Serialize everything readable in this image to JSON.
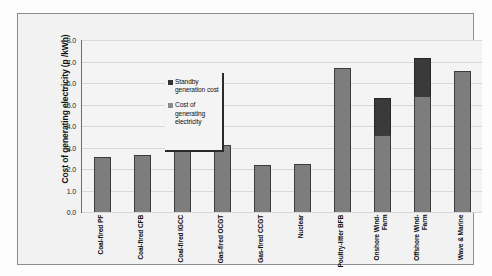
{
  "chart_data": {
    "type": "bar",
    "stacked": true,
    "title": "",
    "xlabel": "",
    "ylabel": "Cost of generating electricity (p /kWh)",
    "ylim": [
      0.0,
      8.0
    ],
    "ytick_labels": [
      "8.0",
      "7.0",
      "6.0",
      "5.0",
      "4.0",
      "3.0",
      "2.0",
      "1.0",
      "0.0"
    ],
    "ytick_values": [
      8.0,
      7.0,
      6.0,
      5.0,
      4.0,
      3.0,
      2.0,
      1.0,
      0.0
    ],
    "grid": true,
    "legend_position": "inside-top-left",
    "categories": [
      "Coal-fired PF",
      "Coal-fired CFB",
      "Coal-fired IGCC",
      "Gas-fired OCGT",
      "Gas-fired CCGT",
      "Nuclear",
      "Poultry-litter BFB",
      "Onshore Wind-Farm",
      "Offshore Wind-Farm",
      "Wave & Marine"
    ],
    "category_lines": [
      [
        "Coal-fired PF"
      ],
      [
        "Coal-fired CFB"
      ],
      [
        "Coal-fired IGCC"
      ],
      [
        "Gas-fired OCGT"
      ],
      [
        "Gas-fired CCGT"
      ],
      [
        "Nuclear"
      ],
      [
        "Poultry-litter BFB"
      ],
      [
        "Onshore Wind-",
        "Farm"
      ],
      [
        "Offshore Wind-",
        "Farm"
      ],
      [
        "Wave & Marine"
      ]
    ],
    "series": [
      {
        "name": "Cost of generating electricity",
        "color": "#7d7d7d",
        "values": [
          2.55,
          2.65,
          3.2,
          3.1,
          2.2,
          2.25,
          6.7,
          3.6,
          5.4,
          6.55
        ]
      },
      {
        "name": "Standby generation cost",
        "color": "#3a3a3a",
        "values": [
          0,
          0,
          0,
          0,
          0,
          0,
          0,
          1.7,
          1.75,
          0
        ]
      }
    ]
  },
  "legend": {
    "entries": [
      {
        "label": "Standby generation cost",
        "swatch": "standby"
      },
      {
        "label": "Cost of generating electricity",
        "swatch": "cost"
      }
    ]
  }
}
